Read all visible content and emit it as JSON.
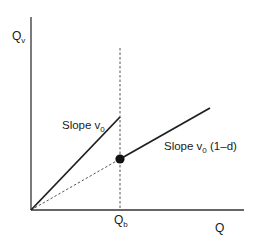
{
  "diagram": {
    "axes": {
      "y_label": "Q",
      "y_label_sub": "v",
      "x_label": "Q",
      "origin": [
        31,
        210
      ],
      "y_axis_top": [
        31,
        17
      ],
      "x_axis_end": [
        244,
        210
      ]
    },
    "breakpoint": {
      "label": "Q",
      "label_sub": "b",
      "x": 120,
      "dashed_top_y": 48,
      "dot": [
        120,
        159
      ]
    },
    "lines": [
      {
        "name": "slope-v0-line",
        "from": [
          31,
          210
        ],
        "to": [
          120,
          117
        ],
        "style": "solid"
      },
      {
        "name": "slope-v0-1-d-line",
        "from": [
          120,
          159
        ],
        "to": [
          210,
          108
        ],
        "style": "solid"
      },
      {
        "name": "projection-dashed-line",
        "from": [
          31,
          210
        ],
        "to": [
          120,
          159
        ],
        "style": "dashed"
      }
    ],
    "annotations": {
      "slope_steep": {
        "prefix": "Slope v",
        "sub": "0",
        "suffix": ""
      },
      "slope_shallow": {
        "prefix": "Slope v",
        "sub": "0",
        "suffix": " (1–d)"
      }
    },
    "colors": {
      "line": "#1f1f1f",
      "axis": "#333333",
      "dashed": "#555555",
      "dot": "#111111"
    }
  }
}
